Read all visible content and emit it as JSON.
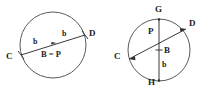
{
  "figure": {
    "background_color": "#ffffff",
    "stroke_color": "#5b5b5b",
    "label_color": "#1c1c1c",
    "width": 212,
    "height": 91
  },
  "diagrams": [
    {
      "id": "left-circle-diagram",
      "name": "circle-with-diameter-cd",
      "center": {
        "cx": 53,
        "cy": 45,
        "label": "B = P"
      },
      "radius": 33,
      "points": [
        {
          "name": "C",
          "label": "C",
          "x": 21,
          "y": 55,
          "text_x": 6,
          "text_y": 59
        },
        {
          "name": "D",
          "label": "D",
          "x": 85,
          "y": 35,
          "text_x": 89,
          "text_y": 36
        }
      ],
      "segment_labels": [
        {
          "label": "b",
          "text_x": 33,
          "text_y": 44
        },
        {
          "label": "b",
          "text_x": 62,
          "text_y": 36
        }
      ],
      "center_label": {
        "label": "B = P",
        "text_x": 41,
        "text_y": 57
      }
    },
    {
      "id": "right-circle-diagram",
      "name": "circle-with-chord-cd-and-diameter-gh",
      "center": {
        "cx": 159,
        "cy": 50,
        "label": "B"
      },
      "radius": 31,
      "points": [
        {
          "name": "G",
          "label": "G",
          "x": 159,
          "y": 19,
          "text_x": 155,
          "text_y": 12
        },
        {
          "name": "H",
          "label": "H",
          "x": 159,
          "y": 81,
          "text_x": 148,
          "text_y": 82
        },
        {
          "name": "C",
          "label": "C",
          "x": 129,
          "y": 59,
          "text_x": 114,
          "text_y": 59
        },
        {
          "name": "D",
          "label": "D",
          "x": 186,
          "y": 29,
          "text_x": 189,
          "text_y": 26
        },
        {
          "name": "P",
          "label": "P",
          "x": 159,
          "y": 33,
          "text_x": 148,
          "text_y": 33
        }
      ],
      "segment_labels": [
        {
          "label": "b",
          "text_x": 162,
          "text_y": 66
        }
      ],
      "center_label": {
        "label": "B",
        "text_x": 164,
        "text_y": 53
      }
    }
  ],
  "all_labels": [
    "C",
    "D",
    "b",
    "b",
    "B = P",
    "G",
    "D",
    "P",
    "C",
    "B",
    "b",
    "H"
  ]
}
